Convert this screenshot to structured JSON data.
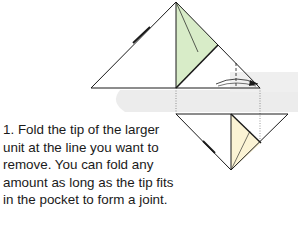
{
  "step": {
    "number": "1.",
    "instruction": "1. Fold the tip of the larger unit at the line you want to remove. You can fold any amount as long as the tip fits in the pocket to form a joint.",
    "lines": [
      "1. Fold the tip of the larger",
      "unit at the line you want to",
      "remove. You can fold any",
      "amount as long as the tip fits",
      "in the pocket to form a joint."
    ]
  },
  "colors": {
    "green_flap": "#d8ecc8",
    "yellow_flap": "#fbf3d4",
    "gray_band": "#ececec",
    "line": "#1a1a1a"
  }
}
